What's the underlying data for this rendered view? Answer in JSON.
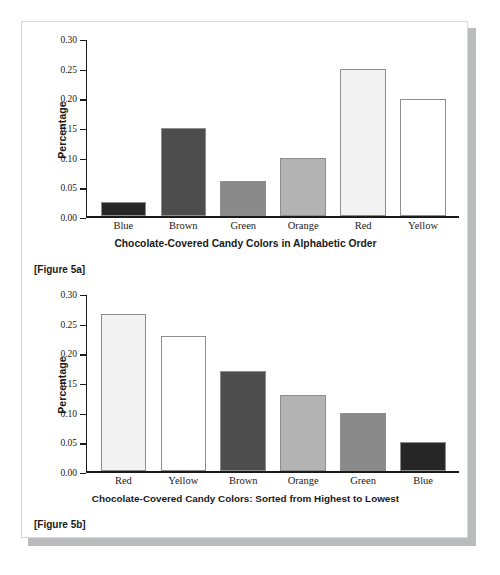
{
  "page": {
    "background_color": "#ffffff",
    "card_background": "#ffffff",
    "card_border_color": "#d8d8d8",
    "card_shadow_color": "#b9bbbd"
  },
  "figures": [
    {
      "id": "figure-5a",
      "caption": "[Figure 5a]",
      "chart_data": {
        "type": "bar",
        "title": "",
        "xlabel": "Chocolate-Covered Candy Colors in Alphabetic Order",
        "ylabel": "Percentage",
        "categories": [
          "Blue",
          "Brown",
          "Green",
          "Orange",
          "Red",
          "Yellow"
        ],
        "values": [
          0.025,
          0.15,
          0.06,
          0.1,
          0.25,
          0.2
        ],
        "bar_colors": [
          "#262626",
          "#4d4d4d",
          "#8a8a8a",
          "#b3b3b3",
          "#f2f2f2",
          "#ffffff"
        ],
        "bar_border_color": "#8e8e8e",
        "ylim": [
          0.0,
          0.3
        ],
        "yticks": [
          0.3,
          0.25,
          0.2,
          0.15,
          0.1,
          0.05,
          0.0
        ],
        "ytick_labels": [
          "0.30",
          "0.25",
          "0.20",
          "0.15",
          "0.10",
          "0.05",
          "0.00"
        ],
        "grid": false,
        "legend": "none"
      }
    },
    {
      "id": "figure-5b",
      "caption": "[Figure 5b]",
      "chart_data": {
        "type": "bar",
        "title": "",
        "xlabel": "Chocolate-Covered Candy Colors: Sorted from Highest to Lowest",
        "ylabel": "Percentage",
        "categories": [
          "Red",
          "Yellow",
          "Brown",
          "Orange",
          "Green",
          "Blue"
        ],
        "values": [
          0.267,
          0.23,
          0.17,
          0.13,
          0.1,
          0.05
        ],
        "bar_colors": [
          "#f2f2f2",
          "#ffffff",
          "#4d4d4d",
          "#b3b3b3",
          "#8a8a8a",
          "#262626"
        ],
        "bar_border_color": "#8e8e8e",
        "ylim": [
          0.0,
          0.3
        ],
        "yticks": [
          0.3,
          0.25,
          0.2,
          0.15,
          0.1,
          0.05,
          0.0
        ],
        "ytick_labels": [
          "0.30",
          "0.25",
          "0.20",
          "0.15",
          "0.10",
          "0.05",
          "0.00"
        ],
        "grid": false,
        "legend": "none"
      }
    }
  ]
}
